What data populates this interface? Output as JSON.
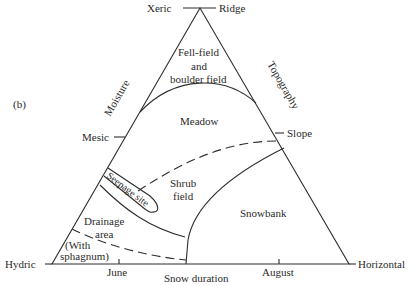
{
  "figure": {
    "panel_label": "(b)",
    "vertices": {
      "top_left": "Xeric",
      "top_right": "Ridge",
      "bottom_left": "Hydric",
      "bottom_right": "Horizontal"
    },
    "axes": {
      "left": {
        "name": "Moisture",
        "mid_tick": "Mesic"
      },
      "right": {
        "name": "Topography",
        "mid_tick": "Slope"
      },
      "bottom": {
        "name": "Snow duration",
        "ticks": [
          "June",
          "August"
        ]
      }
    },
    "zones": {
      "fellfield_line1": "Fell-field",
      "fellfield_line2": "and",
      "fellfield_line3": "boulder field",
      "meadow": "Meadow",
      "seepage": "Seepage site",
      "shrub_line1": "Shrub",
      "shrub_line2": "field",
      "snowbank": "Snowbank",
      "drainage_line1": "Drainage",
      "drainage_line2": "area",
      "sphagnum_line1": "(With",
      "sphagnum_line2": "sphagnum)"
    },
    "colors": {
      "line": "#2e2e2e",
      "text": "#2a2a2a",
      "background": "#ffffff"
    }
  }
}
